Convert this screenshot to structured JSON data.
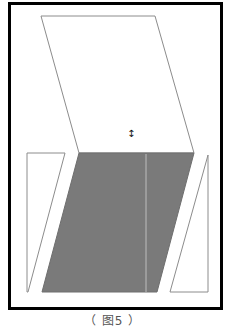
{
  "figure": {
    "caption": "（ 图5 ）",
    "colors": {
      "frame": "#000000",
      "outline": "#8c8c8c",
      "shaded_fill": "#7a7a7a",
      "divider": "#bdbdbd",
      "background": "#ffffff"
    },
    "frame": {
      "x": 9,
      "y": 3,
      "width": 213,
      "height": 306
    },
    "shapes": [
      {
        "name": "top-parallelogram",
        "fill": "none",
        "points": "41,16 155,16 194,153 79,153"
      },
      {
        "name": "shaded-parallelogram",
        "fill": "shaded",
        "points": "79,153 194,153 157,292 42,292"
      },
      {
        "name": "left-trapezoid",
        "fill": "none",
        "points": "27,153 65,153 28,292 27,292"
      },
      {
        "name": "right-triangle",
        "fill": "none",
        "points": "208,155 208,292 170,292"
      }
    ],
    "divider_line": {
      "x": 146,
      "y1": 154,
      "y2": 292
    },
    "cursor": {
      "icon": "vertical-resize-cursor",
      "glyph": "↕",
      "x": 131,
      "y": 137
    }
  }
}
